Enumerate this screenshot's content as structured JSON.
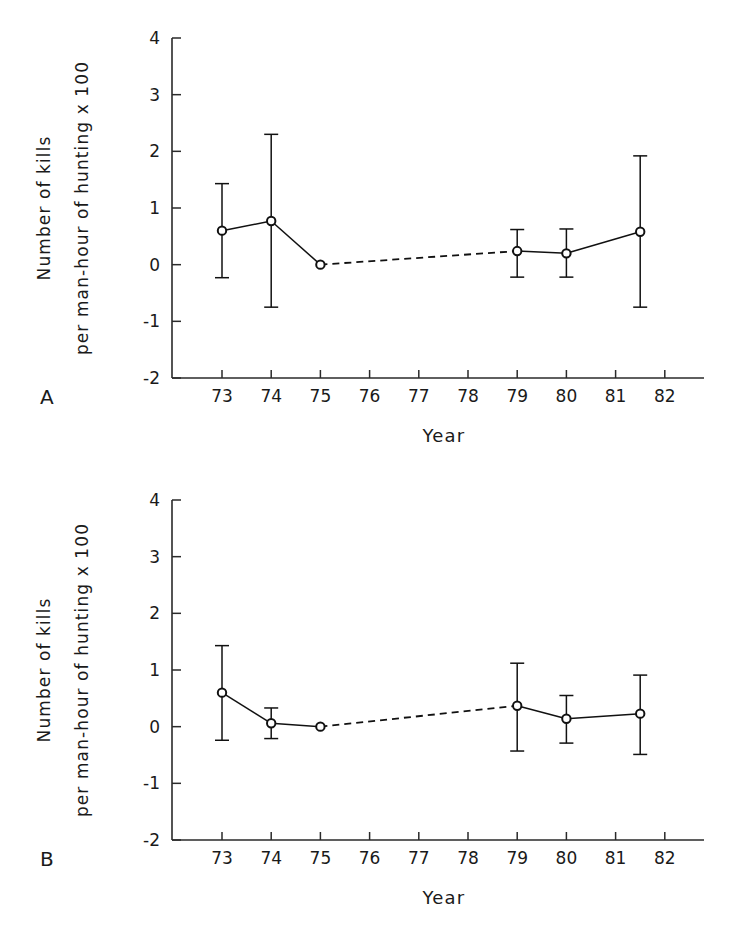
{
  "figure": {
    "background_color": "#ffffff",
    "line_color": "#111111",
    "axis_color": "#2a2a2a",
    "marker_fill": "#ffffff"
  },
  "panels": [
    {
      "letter": "A",
      "xlabel": "Year",
      "ylabel_line1": "Number of kills",
      "ylabel_line2": "per man-hour of hunting x 100"
    },
    {
      "letter": "B",
      "xlabel": "Year",
      "ylabel_line1": "Number of kills",
      "ylabel_line2": "per man-hour of hunting x 100"
    }
  ],
  "axes": {
    "x_ticks": [
      "73",
      "74",
      "75",
      "76",
      "77",
      "78",
      "79",
      "80",
      "81",
      "82"
    ],
    "y_ticks": [
      "4",
      "3",
      "2",
      "1",
      "0",
      "-1",
      "-2"
    ],
    "xlim": [
      72.0,
      82.0
    ],
    "ylim": [
      -2,
      4
    ]
  },
  "chart_data": [
    {
      "type": "line",
      "panel": "A",
      "title": "",
      "xlabel": "Year",
      "ylabel": "Number of kills per man-hour of hunting x 100",
      "xlim": [
        72.0,
        82.0
      ],
      "ylim": [
        -2,
        4
      ],
      "xticks": [
        73,
        74,
        75,
        76,
        77,
        78,
        79,
        80,
        81,
        82
      ],
      "yticks": [
        -2,
        -1,
        0,
        1,
        2,
        3,
        4
      ],
      "grid": false,
      "legend": "none",
      "marker": "open-circle",
      "errorbars": true,
      "x": [
        73,
        74,
        75,
        79,
        80,
        81.5
      ],
      "y": [
        0.6,
        0.77,
        0.0,
        0.24,
        0.2,
        0.58
      ],
      "yerr_lower": [
        -0.23,
        -0.75,
        0.0,
        -0.22,
        -0.22,
        -0.75
      ],
      "yerr_upper": [
        1.43,
        2.3,
        0.0,
        0.62,
        0.63,
        1.92
      ],
      "segments": [
        {
          "from_index": 0,
          "to_index": 1,
          "style": "solid"
        },
        {
          "from_index": 1,
          "to_index": 2,
          "style": "solid"
        },
        {
          "from_index": 2,
          "to_index": 3,
          "style": "dashed"
        },
        {
          "from_index": 3,
          "to_index": 4,
          "style": "solid"
        },
        {
          "from_index": 4,
          "to_index": 5,
          "style": "solid"
        }
      ]
    },
    {
      "type": "line",
      "panel": "B",
      "title": "",
      "xlabel": "Year",
      "ylabel": "Number of kills per man-hour of hunting x 100",
      "xlim": [
        72.0,
        82.0
      ],
      "ylim": [
        -2,
        4
      ],
      "xticks": [
        73,
        74,
        75,
        76,
        77,
        78,
        79,
        80,
        81,
        82
      ],
      "yticks": [
        -2,
        -1,
        0,
        1,
        2,
        3,
        4
      ],
      "grid": false,
      "legend": "none",
      "marker": "open-circle",
      "errorbars": true,
      "x": [
        73,
        74,
        75,
        79,
        80,
        81.5
      ],
      "y": [
        0.6,
        0.06,
        0.0,
        0.37,
        0.14,
        0.23
      ],
      "yerr_lower": [
        -0.24,
        -0.21,
        0.0,
        -0.43,
        -0.29,
        -0.49
      ],
      "yerr_upper": [
        1.43,
        0.33,
        0.0,
        1.12,
        0.55,
        0.91
      ],
      "segments": [
        {
          "from_index": 0,
          "to_index": 1,
          "style": "solid"
        },
        {
          "from_index": 1,
          "to_index": 2,
          "style": "solid"
        },
        {
          "from_index": 2,
          "to_index": 3,
          "style": "dashed"
        },
        {
          "from_index": 3,
          "to_index": 4,
          "style": "solid"
        },
        {
          "from_index": 4,
          "to_index": 5,
          "style": "solid"
        }
      ]
    }
  ]
}
